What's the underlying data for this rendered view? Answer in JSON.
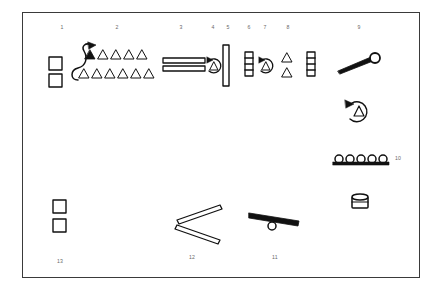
{
  "figure": {
    "kind": "technical-assembly-diagram",
    "background_color": "#ffffff",
    "frame_border_color": "#3a3a3a",
    "ink_color": "#111111",
    "callout_color": "#6a6a6a",
    "frame": {
      "x": 22,
      "y": 12,
      "width": 398,
      "height": 266
    }
  },
  "callouts": [
    {
      "label": "1",
      "x": 62,
      "y": 28
    },
    {
      "label": "2",
      "x": 117,
      "y": 28
    },
    {
      "label": "3",
      "x": 181,
      "y": 28
    },
    {
      "label": "4",
      "x": 213,
      "y": 28
    },
    {
      "label": "5",
      "x": 228,
      "y": 28
    },
    {
      "label": "6",
      "x": 249,
      "y": 28
    },
    {
      "label": "7",
      "x": 265,
      "y": 28
    },
    {
      "label": "8",
      "x": 288,
      "y": 28
    },
    {
      "label": "9",
      "x": 359,
      "y": 28
    },
    {
      "label": "10",
      "x": 398,
      "y": 159
    },
    {
      "label": "11",
      "x": 275,
      "y": 258
    },
    {
      "label": "12",
      "x": 192,
      "y": 258
    },
    {
      "label": "13",
      "x": 60,
      "y": 262
    }
  ],
  "parts": [
    {
      "id": "part-1-squares",
      "name": "stacked-square-plates",
      "callout": "1",
      "shape": "two-squares-stacked",
      "squares": [
        {
          "x": 49,
          "y": 57,
          "size": 13
        },
        {
          "x": 49,
          "y": 74,
          "size": 13
        }
      ]
    },
    {
      "id": "part-2-triangle-array",
      "name": "triangle-array-with-s-curve",
      "callout": "2",
      "shape": "triangle-grid",
      "s_curve": {
        "x": 76,
        "y": 45,
        "width": 16,
        "height": 35
      },
      "arrow_head": {
        "x": 94,
        "y": 46
      },
      "top_row": [
        {
          "x": 90,
          "y": 55,
          "filled": true
        },
        {
          "x": 103,
          "y": 55,
          "filled": false
        },
        {
          "x": 116,
          "y": 55,
          "filled": false
        },
        {
          "x": 129,
          "y": 55,
          "filled": false
        },
        {
          "x": 142,
          "y": 55,
          "filled": false
        }
      ],
      "bottom_row": [
        {
          "x": 84,
          "y": 74,
          "filled": false
        },
        {
          "x": 97,
          "y": 74,
          "filled": false
        },
        {
          "x": 110,
          "y": 74,
          "filled": false
        },
        {
          "x": 123,
          "y": 74,
          "filled": false
        },
        {
          "x": 136,
          "y": 74,
          "filled": false
        },
        {
          "x": 149,
          "y": 74,
          "filled": false
        }
      ]
    },
    {
      "id": "part-3-parallel-bars",
      "name": "parallel-rail-bars",
      "callout": "3",
      "shape": "two-horizontal-bars",
      "bars": [
        {
          "x": 163,
          "y": 58,
          "width": 42,
          "height": 5
        },
        {
          "x": 163,
          "y": 66,
          "width": 42,
          "height": 5
        }
      ]
    },
    {
      "id": "part-4-rotation-marker",
      "name": "rotation-arrow-with-triangle",
      "callout": "4",
      "shape": "circular-arrow-triangle",
      "center": {
        "x": 214,
        "y": 66
      },
      "radius": 7
    },
    {
      "id": "part-5-vertical-bar",
      "name": "tall-vertical-bar",
      "callout": "5",
      "shape": "vertical-bar",
      "rect": {
        "x": 223,
        "y": 45,
        "width": 6,
        "height": 41
      }
    },
    {
      "id": "part-6-ladder",
      "name": "short-ladder-bracket",
      "callout": "6",
      "shape": "ladder",
      "rect": {
        "x": 245,
        "y": 52,
        "width": 8,
        "height": 24
      },
      "rungs": 3
    },
    {
      "id": "part-7-rotation-marker",
      "name": "rotation-arrow-with-triangle",
      "callout": "7",
      "shape": "circular-arrow-triangle",
      "center": {
        "x": 266,
        "y": 66
      },
      "radius": 7
    },
    {
      "id": "part-8-triangles-ladder",
      "name": "triangle-pair-and-ladder",
      "callout": "8",
      "shape": "triangles-plus-ladder",
      "triangles": [
        {
          "x": 287,
          "y": 58,
          "filled": false
        },
        {
          "x": 287,
          "y": 73,
          "filled": false
        }
      ],
      "ladder": {
        "x": 307,
        "y": 52,
        "width": 8,
        "height": 24,
        "rungs": 3
      }
    },
    {
      "id": "part-9-lever",
      "name": "tapered-lever-with-ring",
      "callout": "9",
      "shape": "lever-rod-with-eyelet",
      "rod": {
        "x1": 338,
        "y1": 70,
        "x2": 372,
        "y2": 59
      },
      "ring": {
        "x": 375,
        "y": 58,
        "radius": 5
      }
    },
    {
      "id": "part-rotation-free",
      "name": "rotation-arrow-with-triangle",
      "callout": "",
      "shape": "circular-arrow-triangle",
      "center": {
        "x": 358,
        "y": 111
      },
      "radius": 10
    },
    {
      "id": "part-10-roller-track",
      "name": "roller-row-on-rail",
      "callout": "10",
      "shape": "circles-on-line",
      "line": {
        "x": 335,
        "y": 163,
        "width": 49
      },
      "circles": 5,
      "circle_radius": 4
    },
    {
      "id": "part-drum",
      "name": "small-drum-cylinder",
      "callout": "",
      "shape": "cylinder",
      "rect": {
        "x": 352,
        "y": 194,
        "width": 16,
        "height": 14
      }
    },
    {
      "id": "part-11-seesaw",
      "name": "pivot-bar-on-roller",
      "callout": "11",
      "shape": "bar-with-pivot-circle",
      "bar": {
        "x1": 250,
        "y1": 215,
        "x2": 299,
        "y2": 224
      },
      "pivot": {
        "x": 272,
        "y": 227,
        "radius": 4
      }
    },
    {
      "id": "part-12-angled-bars",
      "name": "angled-bar-pair",
      "callout": "12",
      "shape": "two-angled-bars",
      "bars": [
        {
          "x1": 178,
          "y1": 222,
          "x2": 222,
          "y2": 207
        },
        {
          "x1": 178,
          "y1": 226,
          "x2": 222,
          "y2": 243
        }
      ]
    },
    {
      "id": "part-13-squares",
      "name": "stacked-square-plates",
      "callout": "13",
      "shape": "two-squares-stacked",
      "squares": [
        {
          "x": 53,
          "y": 200,
          "size": 13
        },
        {
          "x": 53,
          "y": 219,
          "size": 13
        }
      ]
    }
  ]
}
